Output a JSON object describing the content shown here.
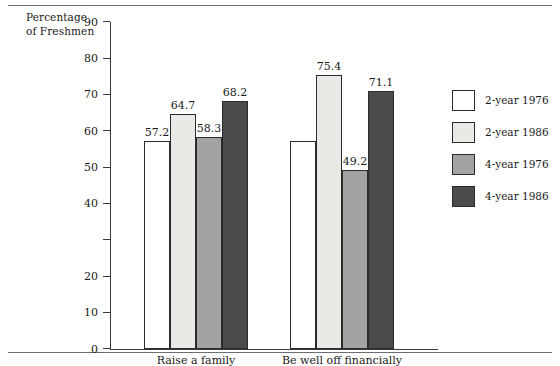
{
  "figure": {
    "top_rule": true,
    "bottom_rule": true
  },
  "chart_data": {
    "type": "bar",
    "title": "",
    "xlabel": "",
    "ylabel": "Percentage of Freshmen",
    "ylabel_lines": [
      "Percentage",
      "of Freshmen"
    ],
    "ylim": [
      0,
      90
    ],
    "ytick_step": 10,
    "yticks": [
      0,
      10,
      20,
      30,
      40,
      50,
      60,
      70,
      80,
      90
    ],
    "ytick_labels": [
      "0",
      "10",
      "20",
      "30",
      "40",
      "50",
      "60",
      "70",
      "80",
      "90"
    ],
    "ytick_labels_visible": [
      true,
      true,
      true,
      false,
      true,
      true,
      true,
      true,
      true,
      true
    ],
    "grid": false,
    "legend_position": "right",
    "categories": [
      "Raise a family",
      "Be well off financially"
    ],
    "series": [
      {
        "name": "2-year 1976",
        "color": "#ffffff",
        "values": [
          57.2,
          57.2
        ],
        "value_labels": [
          "57.2",
          ""
        ]
      },
      {
        "name": "2-year 1986",
        "color": "#e9e9e6",
        "values": [
          64.7,
          75.4
        ],
        "value_labels": [
          "64.7",
          "75.4"
        ]
      },
      {
        "name": "4-year 1976",
        "color": "#a3a3a1",
        "values": [
          58.3,
          49.2
        ],
        "value_labels": [
          "58.3",
          "49.2"
        ]
      },
      {
        "name": "4-year 1986",
        "color": "#4b4b4b",
        "values": [
          68.2,
          71.1
        ],
        "value_labels": [
          "68.2",
          "71.1"
        ]
      }
    ]
  },
  "legend": {
    "items": [
      {
        "label": "2-year 1976",
        "color": "#ffffff"
      },
      {
        "label": "2-year 1986",
        "color": "#e9e9e6"
      },
      {
        "label": "4-year 1976",
        "color": "#a3a3a1"
      },
      {
        "label": "4-year 1986",
        "color": "#4b4b4b"
      }
    ]
  }
}
